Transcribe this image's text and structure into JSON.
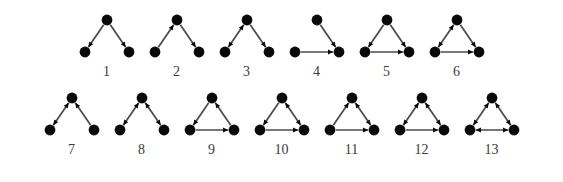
{
  "figure": {
    "background_color": "#ffffff",
    "node_color": "#0a0a0a",
    "edge_color": "#4a4a4a",
    "label_color": "#3a3a3a",
    "node_radius": 5.4,
    "arrow_size": 5.2
  },
  "layout": {
    "node_positions": {
      "top": [
        33,
        12
      ],
      "left": [
        11,
        44
      ],
      "right": [
        55,
        44
      ]
    },
    "rows": [
      {
        "name": "row-1",
        "motif_ids": [
          1,
          2,
          3,
          4,
          5,
          6
        ]
      },
      {
        "name": "row-2",
        "motif_ids": [
          7,
          8,
          9,
          10,
          11,
          12,
          13
        ]
      }
    ]
  },
  "motifs": [
    {
      "id": 1,
      "label": "1",
      "name": "triad-out-star",
      "edges": [
        {
          "from": "top",
          "to": "left",
          "mutual": false
        },
        {
          "from": "top",
          "to": "right",
          "mutual": false
        }
      ]
    },
    {
      "id": 2,
      "label": "2",
      "name": "triad-path",
      "edges": [
        {
          "from": "left",
          "to": "top",
          "mutual": false
        },
        {
          "from": "top",
          "to": "right",
          "mutual": false
        }
      ]
    },
    {
      "id": 3,
      "label": "3",
      "name": "triad-mutual-plus-out",
      "edges": [
        {
          "from": "left",
          "to": "top",
          "mutual": true
        },
        {
          "from": "top",
          "to": "right",
          "mutual": false
        }
      ]
    },
    {
      "id": 4,
      "label": "4",
      "name": "triad-in-star",
      "edges": [
        {
          "from": "top",
          "to": "right",
          "mutual": false
        },
        {
          "from": "left",
          "to": "right",
          "mutual": false
        }
      ]
    },
    {
      "id": 5,
      "label": "5",
      "name": "triad-transitive",
      "edges": [
        {
          "from": "top",
          "to": "left",
          "mutual": false
        },
        {
          "from": "top",
          "to": "right",
          "mutual": false
        },
        {
          "from": "left",
          "to": "right",
          "mutual": false
        }
      ]
    },
    {
      "id": 6,
      "label": "6",
      "name": "triad-mutual-and-two-out",
      "edges": [
        {
          "from": "left",
          "to": "top",
          "mutual": true
        },
        {
          "from": "top",
          "to": "right",
          "mutual": false
        },
        {
          "from": "left",
          "to": "right",
          "mutual": false
        }
      ]
    },
    {
      "id": 7,
      "label": "7",
      "name": "triad-mutual-plus-in",
      "edges": [
        {
          "from": "left",
          "to": "top",
          "mutual": true
        },
        {
          "from": "right",
          "to": "top",
          "mutual": false
        }
      ]
    },
    {
      "id": 8,
      "label": "8",
      "name": "triad-two-mutual-open",
      "edges": [
        {
          "from": "left",
          "to": "top",
          "mutual": true
        },
        {
          "from": "top",
          "to": "right",
          "mutual": true
        }
      ]
    },
    {
      "id": 9,
      "label": "9",
      "name": "triad-cycle",
      "edges": [
        {
          "from": "top",
          "to": "left",
          "mutual": false
        },
        {
          "from": "right",
          "to": "top",
          "mutual": false
        },
        {
          "from": "left",
          "to": "right",
          "mutual": false
        }
      ]
    },
    {
      "id": 10,
      "label": "10",
      "name": "triad-mutual-right-plus-out",
      "edges": [
        {
          "from": "top",
          "to": "left",
          "mutual": false
        },
        {
          "from": "top",
          "to": "right",
          "mutual": true
        },
        {
          "from": "left",
          "to": "right",
          "mutual": false
        }
      ]
    },
    {
      "id": 11,
      "label": "11",
      "name": "triad-mutual-right-plus-in",
      "edges": [
        {
          "from": "left",
          "to": "top",
          "mutual": false
        },
        {
          "from": "top",
          "to": "right",
          "mutual": true
        },
        {
          "from": "left",
          "to": "right",
          "mutual": false
        }
      ]
    },
    {
      "id": 12,
      "label": "12",
      "name": "triad-two-mutual-one-asym",
      "edges": [
        {
          "from": "left",
          "to": "top",
          "mutual": true
        },
        {
          "from": "top",
          "to": "right",
          "mutual": true
        },
        {
          "from": "left",
          "to": "right",
          "mutual": false
        }
      ]
    },
    {
      "id": 13,
      "label": "13",
      "name": "triad-complete-mutual",
      "edges": [
        {
          "from": "left",
          "to": "top",
          "mutual": true
        },
        {
          "from": "top",
          "to": "right",
          "mutual": true
        },
        {
          "from": "left",
          "to": "right",
          "mutual": true
        }
      ]
    }
  ]
}
